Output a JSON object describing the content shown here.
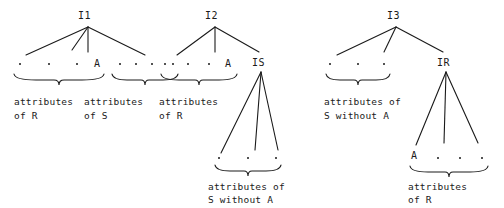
{
  "diagram": {
    "ink_color": "#1a1a1a",
    "background": "#ffffff",
    "dot_glyph": "·",
    "trees": [
      {
        "id": "tree-1",
        "root_label": "I1",
        "branch_count": 4,
        "leaves": [
          {
            "kind": "dot",
            "label": "·"
          },
          {
            "kind": "dot",
            "label": "·"
          },
          {
            "kind": "dot",
            "label": "·"
          },
          {
            "kind": "attr",
            "label": "A"
          },
          {
            "kind": "dot",
            "label": "·"
          },
          {
            "kind": "dot",
            "label": "·"
          },
          {
            "kind": "dot",
            "label": "·"
          },
          {
            "kind": "dot",
            "label": "·"
          }
        ],
        "groups": [
          {
            "caption_line1": "attributes",
            "caption_line2": "of R"
          },
          {
            "caption_line1": "attributes",
            "caption_line2": "of S"
          }
        ]
      },
      {
        "id": "tree-2",
        "root_label": "I2",
        "branch_count": 3,
        "leaves": [
          {
            "kind": "dot",
            "label": "·"
          },
          {
            "kind": "dot",
            "label": "·"
          },
          {
            "kind": "dot",
            "label": "·"
          },
          {
            "kind": "attr",
            "label": "A"
          }
        ],
        "groups": [
          {
            "caption_line1": "attributes",
            "caption_line2": "of R"
          }
        ],
        "subtree": {
          "id": "subtree-is",
          "root_label": "IS",
          "branch_count": 3,
          "leaves": [
            {
              "kind": "dot",
              "label": "·"
            },
            {
              "kind": "dot",
              "label": "·"
            },
            {
              "kind": "dot",
              "label": "·"
            }
          ],
          "groups": [
            {
              "caption_line1": "attributes of",
              "caption_line2": "S without A"
            }
          ]
        }
      },
      {
        "id": "tree-3",
        "root_label": "I3",
        "branch_count": 3,
        "leaves": [
          {
            "kind": "dot",
            "label": "·"
          },
          {
            "kind": "dot",
            "label": "·"
          },
          {
            "kind": "dot",
            "label": "·"
          }
        ],
        "groups": [
          {
            "caption_line1": "attributes of",
            "caption_line2": "S without A"
          }
        ],
        "subtree": {
          "id": "subtree-ir",
          "root_label": "IR",
          "branch_count": 3,
          "leaves": [
            {
              "kind": "attr",
              "label": "A"
            },
            {
              "kind": "dot",
              "label": "·"
            },
            {
              "kind": "dot",
              "label": "·"
            },
            {
              "kind": "dot",
              "label": "·"
            }
          ],
          "groups": [
            {
              "caption_line1": "attributes",
              "caption_line2": "of R"
            }
          ]
        }
      }
    ]
  }
}
